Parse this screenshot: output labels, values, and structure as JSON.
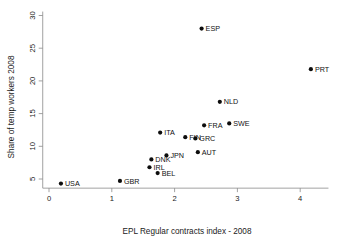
{
  "chart_data": {
    "type": "scatter",
    "title": "",
    "xlabel": "EPL Regular contracts index - 2008",
    "ylabel": "Share of temp workers 2008",
    "xlim": [
      -0.1,
      4.45
    ],
    "ylim": [
      3.6,
      30.6
    ],
    "xticks": [
      "0",
      "1",
      "2",
      "3",
      "4"
    ],
    "xtick_values": [
      0,
      1,
      2,
      3,
      4
    ],
    "yticks": [
      "5",
      "10",
      "15",
      "20",
      "25",
      "30"
    ],
    "ytick_values": [
      5,
      10,
      15,
      20,
      25,
      30
    ],
    "grid": false,
    "legend": "none",
    "marker_color": "#0d0d0d",
    "axis_color": "#8a8a8a",
    "points": [
      {
        "label": "USA",
        "x": 0.19,
        "y": 4.3,
        "label_dx": 4,
        "label_dy": 2.6
      },
      {
        "label": "GBR",
        "x": 1.13,
        "y": 4.7,
        "label_dx": 4,
        "label_dy": 2.6
      },
      {
        "label": "BEL",
        "x": 1.73,
        "y": 5.9,
        "label_dx": 4,
        "label_dy": 2.6
      },
      {
        "label": "IRL",
        "x": 1.6,
        "y": 6.8,
        "label_dx": 4,
        "label_dy": 2.6
      },
      {
        "label": "DNK",
        "x": 1.63,
        "y": 8.0,
        "label_dx": 4,
        "label_dy": 2.6
      },
      {
        "label": "JPN",
        "x": 1.87,
        "y": 8.6,
        "label_dx": 4,
        "label_dy": 2.6
      },
      {
        "label": "AUT",
        "x": 2.37,
        "y": 9.1,
        "label_dx": 4,
        "label_dy": 2.6
      },
      {
        "label": "GRC",
        "x": 2.33,
        "y": 11.2,
        "label_dx": 4,
        "label_dy": 2.6
      },
      {
        "label": "FIN",
        "x": 2.17,
        "y": 11.4,
        "label_dx": 4,
        "label_dy": 2.6
      },
      {
        "label": "ITA",
        "x": 1.77,
        "y": 12.1,
        "label_dx": 4,
        "label_dy": 2.6
      },
      {
        "label": "FRA",
        "x": 2.47,
        "y": 13.2,
        "label_dx": 4,
        "label_dy": 2.6
      },
      {
        "label": "SWE",
        "x": 2.87,
        "y": 13.5,
        "label_dx": 4,
        "label_dy": 2.6
      },
      {
        "label": "NLD",
        "x": 2.72,
        "y": 16.8,
        "label_dx": 4,
        "label_dy": 2.6
      },
      {
        "label": "PRT",
        "x": 4.17,
        "y": 21.8,
        "label_dx": 4,
        "label_dy": 2.6
      },
      {
        "label": "ESP",
        "x": 2.43,
        "y": 28.0,
        "label_dx": 4,
        "label_dy": 2.6
      }
    ]
  }
}
